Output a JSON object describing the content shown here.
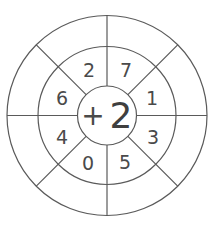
{
  "worksheet": {
    "center": {
      "operator": "+",
      "operand": "2"
    },
    "inner_numbers": [
      {
        "position": "top-left",
        "value": "2",
        "x": 89,
        "y": 70
      },
      {
        "position": "top-right",
        "value": "7",
        "x": 126,
        "y": 70
      },
      {
        "position": "right-upper",
        "value": "1",
        "x": 152,
        "y": 98
      },
      {
        "position": "right-lower",
        "value": "3",
        "x": 153,
        "y": 137
      },
      {
        "position": "bottom-right",
        "value": "5",
        "x": 125,
        "y": 162
      },
      {
        "position": "bottom-left",
        "value": "0",
        "x": 88,
        "y": 163
      },
      {
        "position": "left-lower",
        "value": "4",
        "x": 62,
        "y": 137
      },
      {
        "position": "left-upper",
        "value": "6",
        "x": 62,
        "y": 98
      }
    ],
    "outer_answers": [
      "",
      "",
      "",
      "",
      "",
      "",
      "",
      ""
    ],
    "colors": {
      "line": "#5a5a5a",
      "text": "#4a4a4a",
      "background": "#ffffff"
    }
  }
}
